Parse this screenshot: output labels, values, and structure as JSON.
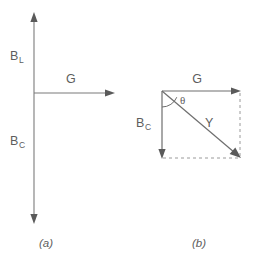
{
  "figure": {
    "background_color": "#ffffff",
    "line_color": "#6e6e6e",
    "dash_color": "#9a9a9a",
    "text_color": "#5d5d5d",
    "panels": [
      {
        "caption": "(a)",
        "description": "Admittance axes: conductance G horizontal, susceptance B vertical",
        "labels": {
          "b_l_base": "B",
          "b_l_sub": "L",
          "g": "G",
          "b_c_base": "B",
          "b_c_sub": "C"
        },
        "axes": {
          "vertical_top_label": "B_L",
          "vertical_bottom_label": "B_C",
          "horizontal_right_label": "G"
        }
      },
      {
        "caption": "(b)",
        "description": "Admittance triangle: G horizontal, B_C vertical, Y hypotenuse, angle theta",
        "labels": {
          "g": "G",
          "b_c_base": "B",
          "b_c_sub": "C",
          "y": "Y",
          "theta": "θ"
        },
        "components": {
          "horizontal_vector": "G",
          "vertical_vector": "B_C",
          "resultant_vector": "Y",
          "angle": "θ"
        }
      }
    ]
  }
}
